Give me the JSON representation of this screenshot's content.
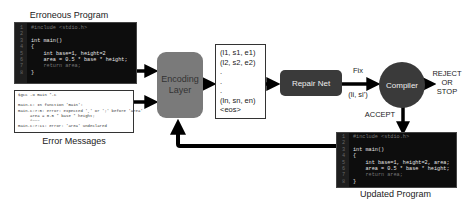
{
  "erroneous_program": {
    "title": "Erroneous Program",
    "lines": [
      {
        "n": "1",
        "text": "#include <stdio.h>",
        "dim": true
      },
      {
        "n": "2",
        "text": "",
        "dim": false
      },
      {
        "n": "3",
        "text": "int main()",
        "dim": false
      },
      {
        "n": "4",
        "text": "{",
        "dim": false
      },
      {
        "n": "5",
        "text": "    int base=1, height=2",
        "dim": false
      },
      {
        "n": "6",
        "text": "    area = 0.5 * base * height;",
        "dim": false
      },
      {
        "n": "7",
        "text": "    return area;",
        "dim": true
      },
      {
        "n": "8",
        "text": "}",
        "dim": false
      }
    ]
  },
  "error_messages": {
    "title": "Error Messages",
    "lines": [
      "$gcc -o main *.c",
      "",
      "main.c: In function 'main':",
      "main.c:7:5: error: expected ',' or ';' before 'area'",
      "     area = 0.5 * base * height;",
      "     ^~~~",
      "main.c:7:11: error: 'area' undeclared"
    ]
  },
  "encoding_layer": {
    "line1": "Encoding",
    "line2": "Layer"
  },
  "sequence": {
    "items": [
      "(l1, s1, e1)",
      "(l2, s2, e2)",
      ".",
      ".",
      ".",
      "(ln, sn, en)",
      "<eos>"
    ]
  },
  "repair_net": {
    "label": "Repair Net"
  },
  "fix_label": {
    "line1": "Fix",
    "line2": "(li, si')"
  },
  "compiler": {
    "label": "Compiler"
  },
  "reject_label": {
    "line1": "REJECT",
    "line2": "OR",
    "line3": "STOP"
  },
  "accept_label": "ACCEPT",
  "updated_program": {
    "title": "Updated Program",
    "lines": [
      {
        "n": "1",
        "text": "#include <stdio.h>",
        "dim": true
      },
      {
        "n": "2",
        "text": "",
        "dim": false
      },
      {
        "n": "3",
        "text": "int main()",
        "dim": false
      },
      {
        "n": "4",
        "text": "{",
        "dim": false
      },
      {
        "n": "5",
        "text": "    int base=1, height=2, area;",
        "dim": false
      },
      {
        "n": "6",
        "text": "    area = 0.5 * base * height;",
        "dim": false
      },
      {
        "n": "7",
        "text": "    return area;",
        "dim": true
      },
      {
        "n": "8",
        "text": "}",
        "dim": false
      }
    ]
  }
}
